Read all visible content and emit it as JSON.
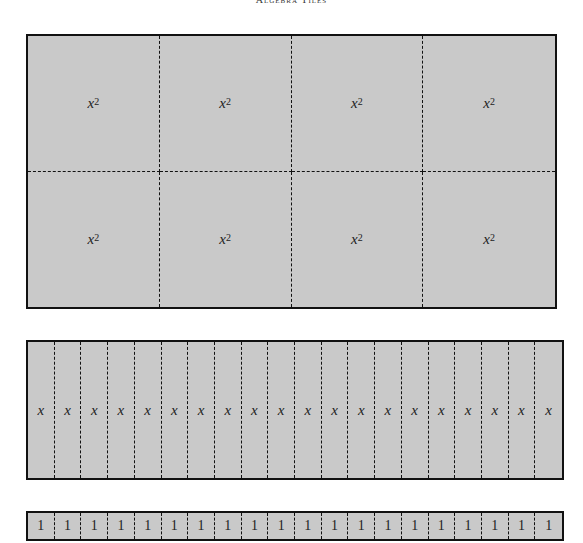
{
  "running_head": "Algebra Tiles",
  "colors": {
    "tile_fill": "#c9c9c9",
    "border": "#111111"
  },
  "x_squared_tiles": {
    "rows": 2,
    "cols": 4,
    "base": "x",
    "exponent": "2",
    "tiles": [
      {
        "base": "x",
        "exp": "2"
      },
      {
        "base": "x",
        "exp": "2"
      },
      {
        "base": "x",
        "exp": "2"
      },
      {
        "base": "x",
        "exp": "2"
      },
      {
        "base": "x",
        "exp": "2"
      },
      {
        "base": "x",
        "exp": "2"
      },
      {
        "base": "x",
        "exp": "2"
      },
      {
        "base": "x",
        "exp": "2"
      }
    ]
  },
  "x_tiles": {
    "count": 20,
    "labels": [
      "x",
      "x",
      "x",
      "x",
      "x",
      "x",
      "x",
      "x",
      "x",
      "x",
      "x",
      "x",
      "x",
      "x",
      "x",
      "x",
      "x",
      "x",
      "x",
      "x"
    ]
  },
  "unit_tiles": {
    "count": 20,
    "labels": [
      "1",
      "1",
      "1",
      "1",
      "1",
      "1",
      "1",
      "1",
      "1",
      "1",
      "1",
      "1",
      "1",
      "1",
      "1",
      "1",
      "1",
      "1",
      "1",
      "1"
    ]
  }
}
